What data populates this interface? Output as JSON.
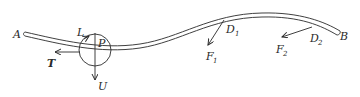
{
  "diagram": {
    "type": "mechanics-free-body",
    "colors": {
      "ink": "#2a2a2a",
      "background": "#ffffff"
    },
    "labels": {
      "end_a": "A",
      "end_b": "B",
      "point_p": "P",
      "moment_l": "L",
      "force_t": "T",
      "force_u": "U",
      "point_d1": "D",
      "point_d1_sub": "1",
      "point_d2": "D",
      "point_d2_sub": "2",
      "force_f1": "F",
      "force_f1_sub": "1",
      "force_f2": "F",
      "force_f2_sub": "2"
    },
    "elements": [
      {
        "name": "rod",
        "description": "curved slender rod from A to B"
      },
      {
        "name": "cut-circle",
        "description": "circle isolating section at point P"
      },
      {
        "name": "force-T",
        "description": "tangential force arrow pointing left"
      },
      {
        "name": "force-U",
        "description": "vertical force arrow pointing down"
      },
      {
        "name": "moment-L",
        "description": "moment arrow at top of circle"
      },
      {
        "name": "force-F1",
        "description": "force applied at D1"
      },
      {
        "name": "force-F2",
        "description": "force applied at D2"
      }
    ]
  }
}
